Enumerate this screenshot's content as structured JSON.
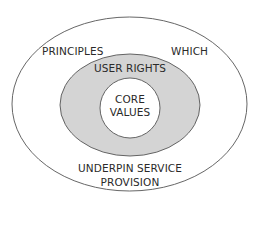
{
  "diagram": {
    "type": "nested-ellipses",
    "colors": {
      "outer_fill": "#ffffff",
      "middle_fill": "#d4d4d4",
      "inner_fill": "#ffffff",
      "stroke": "#555555",
      "text": "#2a2a2a"
    },
    "outer": {
      "label_left": "PRINCIPLES",
      "label_right": "WHICH",
      "label_bottom_line1": "UNDERPIN SERVICE",
      "label_bottom_line2": "PROVISION"
    },
    "middle": {
      "label": "USER RIGHTS"
    },
    "inner": {
      "label_line1": "CORE",
      "label_line2": "VALUES"
    }
  }
}
